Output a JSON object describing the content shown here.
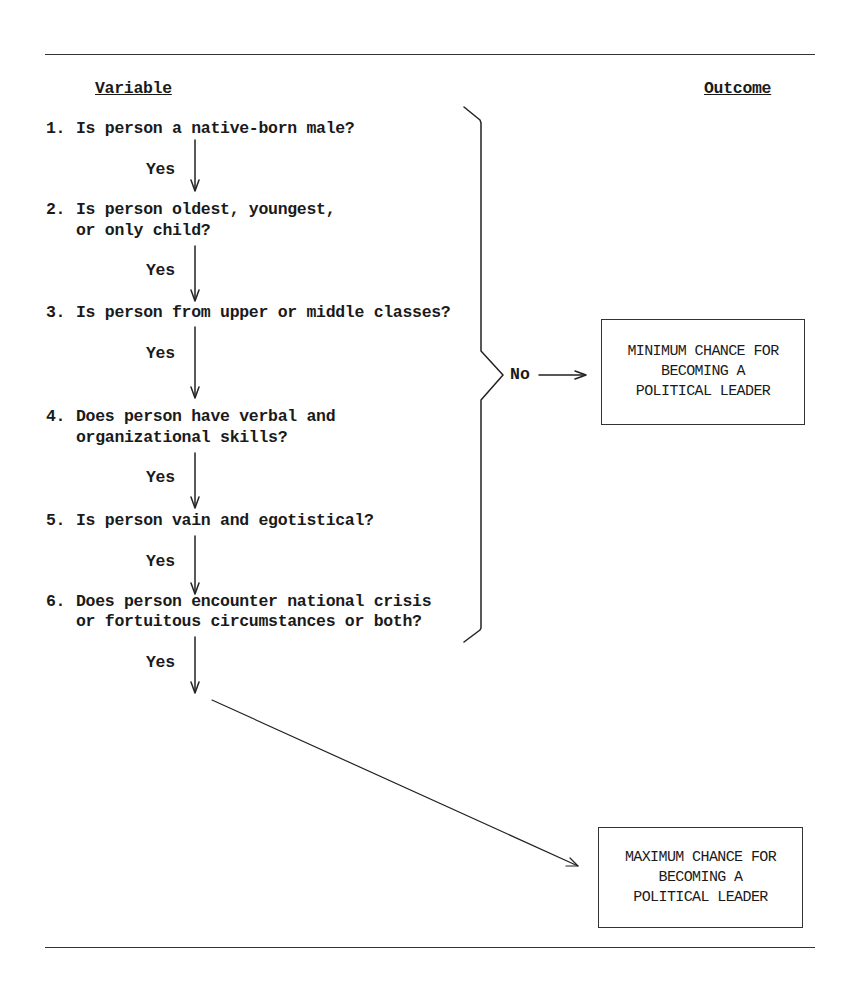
{
  "headers": {
    "variable": "Variable",
    "outcome": "Outcome"
  },
  "variables": [
    {
      "number": "1.",
      "lines": [
        "Is person a native-born male?"
      ]
    },
    {
      "number": "2.",
      "lines": [
        "Is person oldest, youngest,",
        "or only child?"
      ]
    },
    {
      "number": "3.",
      "lines": [
        "Is person from upper or middle classes?"
      ]
    },
    {
      "number": "4.",
      "lines": [
        "Does person have verbal and",
        "organizational skills?"
      ]
    },
    {
      "number": "5.",
      "lines": [
        "Is person vain and egotistical?"
      ]
    },
    {
      "number": "6.",
      "lines": [
        "Does person encounter national crisis",
        "or fortuitous circumstances or both?"
      ]
    }
  ],
  "yes_label": "Yes",
  "no_label": "No",
  "outcomes": {
    "minimum": {
      "lines": [
        "MINIMUM CHANCE FOR",
        "BECOMING A",
        "POLITICAL LEADER"
      ]
    },
    "maximum": {
      "lines": [
        "MAXIMUM CHANCE FOR",
        "BECOMING A",
        "POLITICAL LEADER"
      ]
    }
  },
  "colors": {
    "ink": "#1a1a1a",
    "background": "#ffffff"
  }
}
